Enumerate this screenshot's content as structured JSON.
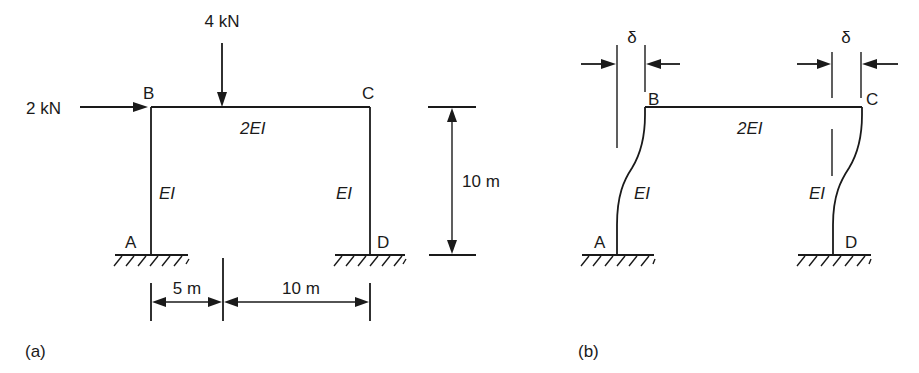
{
  "figure": {
    "panel_a": {
      "caption": "(a)",
      "nodes": {
        "A": "A",
        "B": "B",
        "C": "C",
        "D": "D"
      },
      "loads": {
        "vertical": {
          "label": "4 kN",
          "direction": "down",
          "position": "on BC, 5 m from B"
        },
        "horizontal": {
          "label": "2 kN",
          "direction": "right",
          "position": "at B"
        }
      },
      "members": {
        "beam_BC": "2EI",
        "column_AB": "EI",
        "column_DC": "EI"
      },
      "dimensions": {
        "height": "10 m",
        "span_left": "5 m",
        "span_right": "10 m"
      },
      "supports": {
        "A": "fixed",
        "D": "fixed"
      }
    },
    "panel_b": {
      "caption": "(b)",
      "nodes": {
        "A": "A",
        "B": "B",
        "C": "C",
        "D": "D"
      },
      "members": {
        "beam_BC": "2EI",
        "column_AB": "EI",
        "column_DC": "EI"
      },
      "sway_left": "δ",
      "sway_right": "δ",
      "description": "Deflected shape of frame with sway δ"
    }
  }
}
